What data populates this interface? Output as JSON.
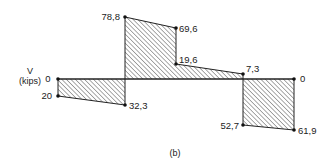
{
  "diagram": {
    "type": "shear-force-diagram",
    "axis_label": {
      "symbol": "V",
      "unit": "(kips)"
    },
    "caption": "(b)",
    "colors": {
      "stroke": "#222222",
      "hatch": "#555555",
      "background": "#ffffff"
    },
    "baseline_value": 0,
    "points": [
      {
        "id": "p0",
        "label": "0",
        "value": 0
      },
      {
        "id": "p1",
        "label": "20",
        "value": -20
      },
      {
        "id": "p2",
        "label": "32,3",
        "value": -32.3
      },
      {
        "id": "p3",
        "label": "78,8",
        "value": 78.8
      },
      {
        "id": "p4",
        "label": "69,6",
        "value": 69.6
      },
      {
        "id": "p5",
        "label": "19,6",
        "value": 19.6
      },
      {
        "id": "p6",
        "label": "7,3",
        "value": 7.3
      },
      {
        "id": "p7",
        "label": "52,7",
        "value": -52.7
      },
      {
        "id": "p8",
        "label": "61,9",
        "value": -61.9
      },
      {
        "id": "p9",
        "label": "0",
        "value": 0
      }
    ],
    "regions": [
      {
        "name": "segment-1-negative",
        "from": "0",
        "to": "-20 → -32.3"
      },
      {
        "name": "segment-2-positive",
        "from": "78.8 → 69.6",
        "to": "19.6 → 7.3"
      },
      {
        "name": "segment-3-negative",
        "from": "-52.7",
        "to": "-61.9 → 0"
      }
    ]
  }
}
